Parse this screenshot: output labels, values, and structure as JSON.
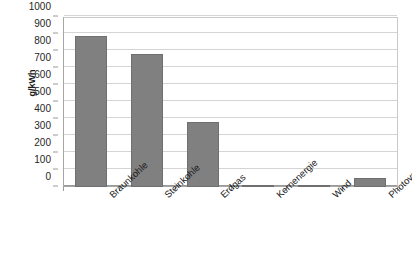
{
  "chart_data": {
    "type": "bar",
    "title": "",
    "subtitle": "",
    "xlabel": "",
    "ylabel": "g/kWh",
    "categories": [
      "Braunkohle",
      "Steinkohle",
      "Erdgas",
      "Kernenergie",
      "Wind",
      "Photovoltaik"
    ],
    "values": [
      890,
      780,
      380,
      8,
      12,
      55
    ],
    "series": [
      {
        "name": "CO2-Emissionen",
        "values": [
          890,
          780,
          380,
          8,
          12,
          55
        ]
      }
    ],
    "ylim": [
      0,
      1000
    ],
    "ytick_step": 100,
    "yticks": [
      0,
      100,
      200,
      300,
      400,
      500,
      600,
      700,
      800,
      900,
      1000
    ],
    "ytick_labels": [
      "0",
      "100",
      "200",
      "300",
      "400",
      "500",
      "600",
      "700",
      "800",
      "900",
      "1000"
    ],
    "grid": true,
    "grid_axis": "y",
    "legend": false,
    "legend_position": "none",
    "bar_color": "#808080",
    "bar_border_color": "#6f6f6f",
    "grid_color": "#d4d4d4",
    "axis_color": "#9a9a9a",
    "text_color": "#1a1a1a",
    "background": "#ffffff",
    "xlabel_rotation": -43,
    "annotations": []
  }
}
